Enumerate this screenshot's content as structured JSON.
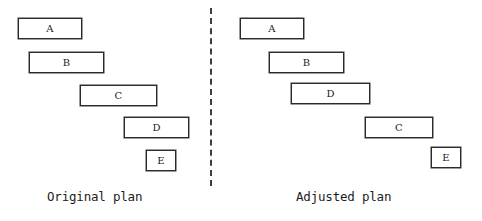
{
  "figure": {
    "width": 482,
    "height": 221,
    "background_color": "#ffffff",
    "bar_fill_color": "#ffffff",
    "bar_border_color": "#2b2b2b",
    "text_color": "#1a1a1a",
    "divider": {
      "style": "dashed",
      "orientation": "vertical",
      "color": "#3d3d3d"
    }
  },
  "chart_data": {
    "type": "bar",
    "title": "",
    "subtitle": "",
    "xlabel": "",
    "ylabel": "",
    "grid": false,
    "legend": null,
    "orientation": "horizontal",
    "panels": [
      {
        "id": "original",
        "caption": "Original plan",
        "tasks": [
          {
            "label": "A",
            "row": 1,
            "start": 0,
            "end": 64,
            "duration": 64
          },
          {
            "label": "B",
            "row": 2,
            "start": 11,
            "end": 86,
            "duration": 75
          },
          {
            "label": "C",
            "row": 3,
            "start": 62,
            "end": 139,
            "duration": 77
          },
          {
            "label": "D",
            "row": 4,
            "start": 106,
            "end": 171,
            "duration": 65
          },
          {
            "label": "E",
            "row": 5,
            "start": 128,
            "end": 158,
            "duration": 30
          }
        ]
      },
      {
        "id": "adjusted",
        "caption": "Adjusted plan",
        "tasks": [
          {
            "label": "A",
            "row": 1,
            "start": 0,
            "end": 64,
            "duration": 64
          },
          {
            "label": "B",
            "row": 2,
            "start": 29,
            "end": 104,
            "duration": 75
          },
          {
            "label": "D",
            "row": 3,
            "start": 51,
            "end": 130,
            "duration": 79
          },
          {
            "label": "C",
            "row": 4,
            "start": 125,
            "end": 193,
            "duration": 68
          },
          {
            "label": "E",
            "row": 5,
            "start": 191,
            "end": 221,
            "duration": 30
          }
        ]
      }
    ]
  },
  "panels": {
    "original": {
      "caption": "Original plan",
      "bars": [
        {
          "label": "A",
          "x": 18,
          "y": 18,
          "w": 64,
          "h": 21
        },
        {
          "label": "B",
          "x": 29,
          "y": 52,
          "w": 75,
          "h": 21
        },
        {
          "label": "C",
          "x": 80,
          "y": 85,
          "w": 77,
          "h": 21
        },
        {
          "label": "D",
          "x": 124,
          "y": 117,
          "w": 65,
          "h": 21
        },
        {
          "label": "E",
          "x": 146,
          "y": 150,
          "w": 30,
          "h": 21
        }
      ]
    },
    "adjusted": {
      "caption": "Adjusted plan",
      "bars": [
        {
          "label": "A",
          "x": 240,
          "y": 18,
          "w": 64,
          "h": 21
        },
        {
          "label": "B",
          "x": 269,
          "y": 52,
          "w": 75,
          "h": 21
        },
        {
          "label": "D",
          "x": 291,
          "y": 83,
          "w": 79,
          "h": 21
        },
        {
          "label": "C",
          "x": 365,
          "y": 117,
          "w": 68,
          "h": 21
        },
        {
          "label": "E",
          "x": 431,
          "y": 147,
          "w": 30,
          "h": 21
        }
      ]
    }
  }
}
